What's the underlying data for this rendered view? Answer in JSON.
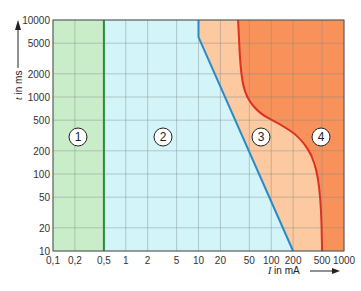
{
  "chart_data": {
    "type": "area",
    "title": "",
    "xlabel": "I in mA",
    "ylabel": "t in ms",
    "xscale": "log",
    "yscale": "log",
    "xlim": [
      0.1,
      1000
    ],
    "ylim": [
      10,
      10000
    ],
    "grid": true,
    "x_ticks": [
      "0,1",
      "0,2",
      "0,5",
      "1",
      "2",
      "5",
      "10",
      "20",
      "50",
      "100",
      "200",
      "500",
      "1000"
    ],
    "x_tick_values": [
      0.1,
      0.2,
      0.5,
      1,
      2,
      5,
      10,
      20,
      50,
      100,
      200,
      500,
      1000
    ],
    "y_ticks": [
      "10000",
      "5000",
      "2000",
      "1000",
      "500",
      "200",
      "100",
      "50",
      "20",
      "10"
    ],
    "y_tick_values": [
      10000,
      5000,
      2000,
      1000,
      500,
      200,
      100,
      50,
      20,
      10
    ],
    "zones": [
      {
        "label": "1",
        "color": "#c9ecc9"
      },
      {
        "label": "2",
        "color": "#d3f4f8"
      },
      {
        "label": "3",
        "color": "#fcc9a0"
      },
      {
        "label": "4",
        "color": "#f8925a"
      }
    ],
    "series": [
      {
        "name": "boundary 1-2",
        "color": "#2e8b3c",
        "points": [
          [
            0.5,
            10
          ],
          [
            0.5,
            10000
          ]
        ]
      },
      {
        "name": "boundary 2-3",
        "color": "#2a8ac8",
        "points": [
          [
            10,
            10000
          ],
          [
            10,
            6000
          ],
          [
            200,
            10
          ]
        ]
      },
      {
        "name": "boundary 3-4",
        "color": "#e0301e",
        "points": [
          [
            35,
            10000
          ],
          [
            38,
            2000
          ],
          [
            45,
            1000
          ],
          [
            70,
            600
          ],
          [
            130,
            450
          ],
          [
            250,
            300
          ],
          [
            400,
            150
          ],
          [
            480,
            50
          ],
          [
            500,
            10
          ]
        ]
      }
    ]
  },
  "zone_labels": [
    "1",
    "2",
    "3",
    "4"
  ],
  "axis": {
    "x_title_italic": "I",
    "x_title_rest": " in mA",
    "y_title_italic": "t",
    "y_title_rest": " in ms"
  }
}
